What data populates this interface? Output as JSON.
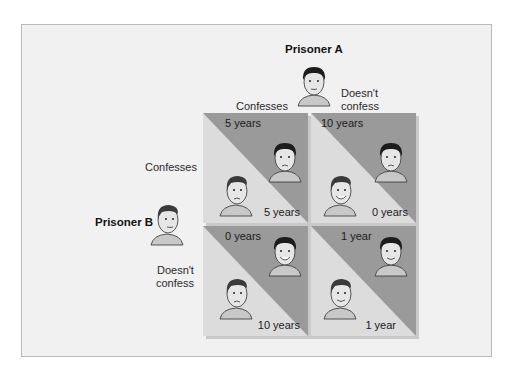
{
  "diagram": {
    "title_col": "Prisoner A",
    "title_row": "Prisoner B",
    "col_headers": [
      "Confesses",
      "Doesn't\nconfess"
    ],
    "row_headers": [
      "Confesses",
      "Doesn't\nconfess"
    ],
    "colors": {
      "background": "#f1f1f1",
      "dark_triangle": "#9a9a9a",
      "light_triangle": "#dcdcdc",
      "frame_border": "#b9b9b9"
    },
    "cells": [
      {
        "row": "Confesses",
        "col": "Confesses",
        "prisoner_a": "5 years",
        "prisoner_b": "5 years"
      },
      {
        "row": "Confesses",
        "col": "Doesn't confess",
        "prisoner_a": "10 years",
        "prisoner_b": "0 years"
      },
      {
        "row": "Doesn't confess",
        "col": "Confesses",
        "prisoner_a": "0 years",
        "prisoner_b": "10 years"
      },
      {
        "row": "Doesn't confess",
        "col": "Doesn't confess",
        "prisoner_a": "1 year",
        "prisoner_b": "1 year"
      }
    ]
  }
}
